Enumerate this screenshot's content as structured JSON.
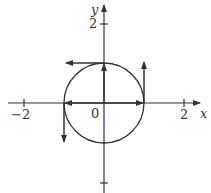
{
  "diagram": {
    "type": "unit-circle-vectors",
    "axes": {
      "x_label": "x",
      "y_label": "y",
      "origin_label": "0",
      "x_ticks": [
        {
          "value": -2,
          "label": "−2"
        },
        {
          "value": 2,
          "label": "2"
        }
      ],
      "y_ticks": [
        {
          "value": 2,
          "label": "2"
        },
        {
          "value": -2,
          "label": ""
        }
      ]
    },
    "circle": {
      "center": [
        0,
        0
      ],
      "radius": 1
    },
    "position_vectors": [
      {
        "from": [
          0,
          0
        ],
        "to": [
          1,
          0
        ]
      },
      {
        "from": [
          0,
          0
        ],
        "to": [
          0,
          1
        ]
      },
      {
        "from": [
          0,
          0
        ],
        "to": [
          -1,
          0
        ]
      }
    ],
    "velocity_vectors": [
      {
        "from": [
          1,
          0
        ],
        "to": [
          1,
          0.8
        ]
      },
      {
        "from": [
          0,
          1
        ],
        "to": [
          -0.9,
          1
        ]
      },
      {
        "from": [
          -1,
          0
        ],
        "to": [
          -1,
          -0.85
        ]
      }
    ],
    "colors": {
      "stroke": "#333333",
      "background": "#ffffff"
    }
  }
}
